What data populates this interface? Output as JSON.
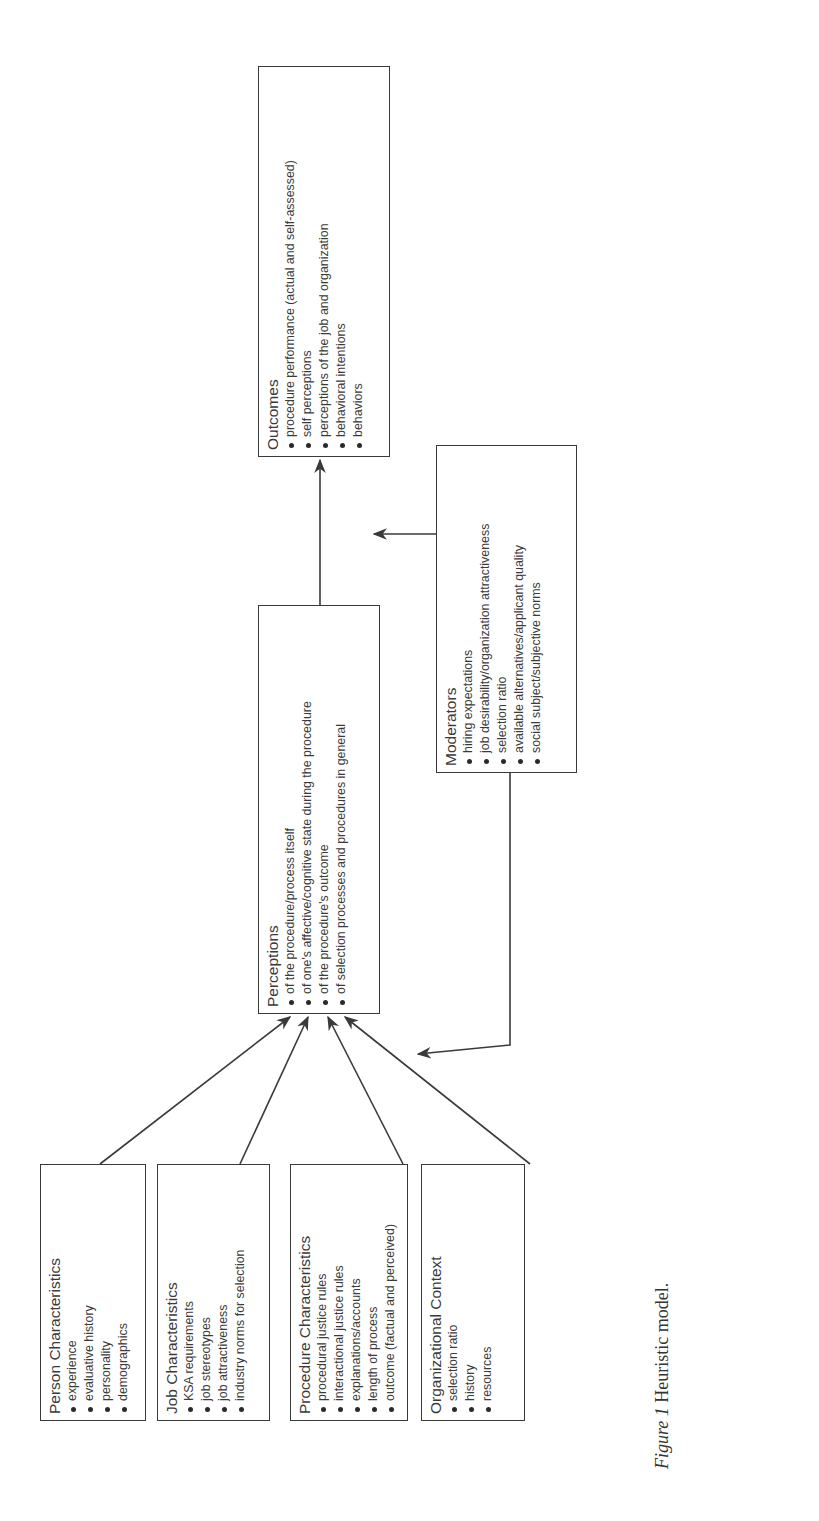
{
  "figure": {
    "caption_label": "Figure 1",
    "caption_text": "Heuristic model.",
    "orientation": "rotated 90° counter-clockwise (landscape figure on portrait page)"
  },
  "antecedents": [
    {
      "title": "Person Characteristics",
      "items": [
        "experience",
        "evaluative history",
        "personality",
        "demographics"
      ]
    },
    {
      "title": "Job Characteristics",
      "items": [
        "KSA requirements",
        "job stereotypes",
        "job attractiveness",
        "industry norms for selection"
      ]
    },
    {
      "title": "Procedure Characteristics",
      "items": [
        "procedural justice rules",
        "interactional justice rules",
        "explanations/accounts",
        "length of process",
        "outcome (factual and perceived)"
      ]
    },
    {
      "title": "Organizational Context",
      "items": [
        "selection ratio",
        "history",
        "resources"
      ]
    }
  ],
  "perceptions": {
    "title": "Perceptions",
    "items": [
      "of the procedure/process itself",
      "of one's affective/cognitive state during the procedure",
      "of the procedure's outcome",
      "of selection processes and procedures in general"
    ]
  },
  "moderators": {
    "title": "Moderators",
    "items": [
      "hiring expectations",
      "job desirability/organization attractiveness",
      "selection ratio",
      "available alternatives/applicant quality",
      "social subject/subjective norms"
    ]
  },
  "outcomes": {
    "title": "Outcomes",
    "items": [
      "procedure performance (actual and self-assessed)",
      "self perceptions",
      "perceptions of the job and organization",
      "behavioral intentions",
      "behaviors"
    ]
  },
  "edges": [
    {
      "from": "Person Characteristics",
      "to": "Perceptions"
    },
    {
      "from": "Job Characteristics",
      "to": "Perceptions"
    },
    {
      "from": "Procedure Characteristics",
      "to": "Perceptions"
    },
    {
      "from": "Organizational Context",
      "to": "Perceptions"
    },
    {
      "from": "Perceptions",
      "to": "Outcomes"
    },
    {
      "from": "Moderators",
      "to": "Perceptions→Outcomes link"
    },
    {
      "from": "Moderators",
      "to": "Antecedents→Perceptions links"
    }
  ],
  "colors": {
    "line": "#3a3a3a",
    "text": "#333333",
    "background": "#ffffff"
  }
}
